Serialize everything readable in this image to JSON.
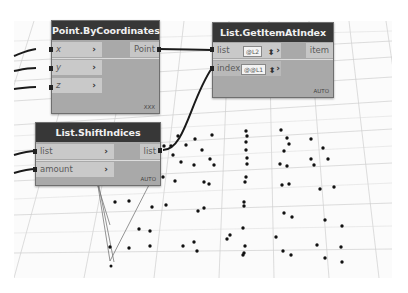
{
  "nodes": {
    "point_by_coordinates": {
      "title": "Point.ByCoordinates",
      "inputs": [
        {
          "label": "x",
          "arrow": "›"
        },
        {
          "label": "y",
          "arrow": "›"
        },
        {
          "label": "z",
          "arrow": "›"
        }
      ],
      "output": "Point",
      "lacing": "XXX"
    },
    "list_get_item_at_index": {
      "title": "List.GetItemAtIndex",
      "inputs": [
        {
          "label": "list",
          "level": "@L2",
          "spinner": "⬍",
          "arrow": "›"
        },
        {
          "label": "index",
          "level": "@@L1",
          "spinner": "⬍",
          "arrow": "›"
        }
      ],
      "output": "item",
      "lacing": "AUTO"
    },
    "list_shift_indices": {
      "title": "List.ShiftIndices",
      "inputs": [
        {
          "label": "list",
          "arrow": "›"
        },
        {
          "label": "amount",
          "arrow": "›"
        }
      ],
      "output": "list",
      "lacing": "AUTO"
    }
  },
  "colors": {
    "node_header": "#373737",
    "node_body": "#a9a9a9",
    "port_input": "#c9c9c9",
    "wire": "#1a1a1a",
    "point": "#111111",
    "grid": "#c8c8c8"
  }
}
